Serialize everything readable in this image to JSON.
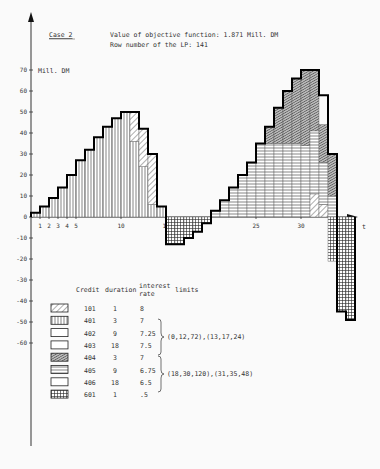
{
  "header": {
    "case_label": "Case 2",
    "objective_line": "Value of objective function: 1.871 Mill. DM",
    "row_line": "Row number of the LP:  141"
  },
  "axes": {
    "y_unit": "Mill. DM",
    "x_label": "t",
    "y_ticks": [
      "70",
      "60",
      "50",
      "40",
      "30",
      "20",
      "10",
      "0",
      "-10",
      "-20",
      "-30",
      "-40",
      "-50",
      "-60"
    ],
    "x_ticks": [
      "1",
      "2",
      "3",
      "4",
      "5",
      "10",
      "15",
      "25",
      "30"
    ]
  },
  "legend": {
    "headers": {
      "credit": "Credit",
      "duration": "duration",
      "rate1": "interest",
      "rate2": "rate",
      "limits": "limits"
    },
    "rows": [
      {
        "credit": "101",
        "duration": "1",
        "rate": "8",
        "pattern": "diag"
      },
      {
        "credit": "401",
        "duration": "3",
        "rate": "7",
        "pattern": "vert"
      },
      {
        "credit": "402",
        "duration": "9",
        "rate": "7.25",
        "pattern": "blank"
      },
      {
        "credit": "403",
        "duration": "18",
        "rate": "7.5",
        "pattern": "blank"
      },
      {
        "credit": "404",
        "duration": "3",
        "rate": "7",
        "pattern": "dense"
      },
      {
        "credit": "405",
        "duration": "9",
        "rate": "6.75",
        "pattern": "horiz"
      },
      {
        "credit": "406",
        "duration": "18",
        "rate": "6.5",
        "pattern": "blank"
      },
      {
        "credit": "601",
        "duration": "1",
        "rate": ".5",
        "pattern": "grid"
      }
    ],
    "limits_group1": "(0,12,72),(13,17,24)",
    "limits_group2": "(18,30,120),(31,35,48)"
  },
  "chart_data": {
    "type": "bar",
    "xlabel": "t",
    "ylabel": "Mill. DM",
    "ylim": [
      -60,
      70
    ],
    "grid": false,
    "x": [
      1,
      2,
      3,
      4,
      5,
      6,
      7,
      8,
      9,
      10,
      11,
      12,
      13,
      14,
      15,
      16,
      17,
      18,
      19,
      20,
      21,
      22,
      23,
      24,
      25,
      26,
      27,
      28,
      29,
      30,
      31,
      32,
      33,
      34,
      35,
      36
    ],
    "series": [
      {
        "name": "Credit 401 (3 periods, 7%)",
        "pattern": "vertical lines",
        "values": [
          2,
          5,
          9,
          14,
          20,
          27,
          32,
          38,
          43,
          47,
          50,
          36,
          24,
          6,
          5,
          0,
          0,
          0,
          0,
          0,
          0,
          0,
          0,
          0,
          0,
          0,
          0,
          0,
          0,
          0,
          0,
          0,
          0,
          0,
          0,
          0
        ]
      },
      {
        "name": "Credit 101 (1 period, 8%)",
        "pattern": "diagonal hatch",
        "values": [
          0,
          0,
          0,
          0,
          0,
          0,
          0,
          0,
          0,
          0,
          0,
          14,
          18,
          24,
          0,
          0,
          0,
          0,
          0,
          0,
          0,
          0,
          0,
          0,
          0,
          0,
          0,
          0,
          0,
          0,
          0,
          11,
          6,
          0,
          0,
          0
        ]
      },
      {
        "name": "Credit 405 (9 periods, 6.75%)",
        "pattern": "horizontal lines",
        "values": [
          0,
          0,
          0,
          0,
          0,
          0,
          0,
          0,
          0,
          0,
          0,
          0,
          0,
          0,
          0,
          0,
          0,
          0,
          0,
          0,
          3,
          8,
          14,
          20,
          26,
          35,
          35,
          35,
          35,
          35,
          34,
          30,
          20,
          10,
          0,
          0
        ]
      },
      {
        "name": "Credit 404 (3 periods, 7%)",
        "pattern": "dense diagonal",
        "values": [
          0,
          0,
          0,
          0,
          0,
          0,
          0,
          0,
          0,
          0,
          0,
          0,
          0,
          0,
          0,
          0,
          0,
          0,
          0,
          0,
          0,
          0,
          0,
          0,
          0,
          0,
          8,
          17,
          25,
          31,
          36,
          29,
          18,
          20,
          0,
          0
        ]
      },
      {
        "name": "Credit 601 (1 period, 0.5%)",
        "pattern": "grid",
        "values": [
          0,
          0,
          0,
          0,
          0,
          0,
          0,
          0,
          0,
          0,
          0,
          0,
          0,
          0,
          0,
          -13,
          -13,
          -10,
          -7,
          -3,
          0,
          0,
          0,
          0,
          0,
          0,
          0,
          0,
          0,
          0,
          0,
          0,
          0,
          -21,
          -45,
          -49
        ]
      }
    ],
    "totals": [
      2,
      5,
      9,
      14,
      20,
      27,
      32,
      38,
      43,
      47,
      50,
      50,
      42,
      30,
      5,
      -13,
      -13,
      -10,
      -7,
      -3,
      3,
      8,
      14,
      20,
      26,
      35,
      43,
      52,
      60,
      66,
      70,
      70,
      58,
      30,
      -45,
      -49
    ],
    "legend_position": "bottom-left table"
  }
}
